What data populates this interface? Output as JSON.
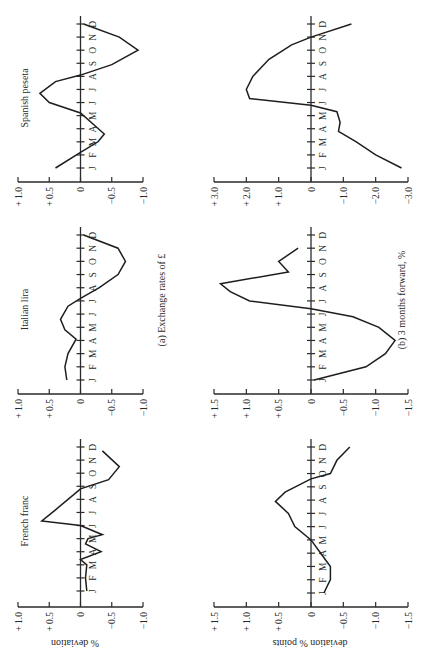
{
  "figure": {
    "orientation": "rotated 90deg counter-clockwise (text reads bottom-to-top)",
    "captions": {
      "a": "(a)  Exchange rates of £",
      "b": "(b)  3 months forward, %"
    },
    "ylabels": {
      "a": "% deviation",
      "b": "deviation % points"
    },
    "months": [
      "J",
      "F",
      "M",
      "A",
      "M",
      "J",
      "J",
      "A",
      "S",
      "O",
      "N",
      "D"
    ]
  },
  "chart_data": [
    {
      "type": "line",
      "row": "a",
      "title": "French franc",
      "xlabel": "",
      "ylabel": "% deviation",
      "x": [
        "J",
        "F",
        "M",
        "A",
        "M",
        "J",
        "J",
        "A",
        "S",
        "O",
        "N",
        "D"
      ],
      "x_points": [
        1.0,
        2.0,
        3.0,
        3.4,
        4.0,
        4.6,
        5.3,
        6.0,
        7.0,
        8.0,
        9.0,
        10.0,
        11.0,
        12.0
      ],
      "values": [
        -0.1,
        -0.1,
        -0.1,
        -0.03,
        -0.33,
        -0.1,
        -0.35,
        0.0,
        0.62,
        0.4,
        0.2,
        -0.05,
        -0.45,
        -0.6,
        -0.35
      ],
      "series": [
        {
          "name": "French franc",
          "points": [
            [
              1.0,
              -0.1
            ],
            [
              2.0,
              -0.08
            ],
            [
              3.0,
              -0.1
            ],
            [
              3.4,
              0.0
            ],
            [
              4.0,
              -0.33
            ],
            [
              4.6,
              -0.08
            ],
            [
              5.0,
              -0.12
            ],
            [
              5.3,
              -0.35
            ],
            [
              6.0,
              0.0
            ],
            [
              6.35,
              0.62
            ],
            [
              7.2,
              0.4
            ],
            [
              8.0,
              0.2
            ],
            [
              8.8,
              0.0
            ],
            [
              9.5,
              -0.45
            ],
            [
              10.5,
              -0.62
            ],
            [
              11.7,
              -0.35
            ]
          ]
        }
      ],
      "yticks": [
        "+ 1.0",
        "+ 0.5",
        "0",
        "−0.5",
        "−1.0"
      ],
      "ylim": [
        -1.0,
        1.0
      ],
      "grid": false
    },
    {
      "type": "line",
      "row": "a",
      "title": "Italian lira",
      "xlabel": "",
      "ylabel": "% deviation",
      "x": [
        "J",
        "F",
        "M",
        "A",
        "M",
        "J",
        "J",
        "A",
        "S",
        "O",
        "N",
        "D"
      ],
      "series": [
        {
          "name": "Italian lira",
          "points": [
            [
              1.0,
              0.22
            ],
            [
              2.0,
              0.25
            ],
            [
              3.0,
              0.2
            ],
            [
              4.1,
              0.07
            ],
            [
              4.8,
              0.25
            ],
            [
              5.6,
              0.32
            ],
            [
              6.6,
              0.2
            ],
            [
              7.2,
              0.0
            ],
            [
              8.0,
              -0.3
            ],
            [
              9.0,
              -0.6
            ],
            [
              10.0,
              -0.72
            ],
            [
              11.0,
              -0.6
            ],
            [
              12.0,
              -0.05
            ]
          ]
        }
      ],
      "yticks": [
        "+ 1.0",
        "+ 0.5",
        "0",
        "−0.5",
        "−1.0"
      ],
      "ylim": [
        -1.0,
        1.0
      ],
      "grid": false
    },
    {
      "type": "line",
      "row": "a",
      "title": "Spanish peseta",
      "xlabel": "",
      "ylabel": "% deviation",
      "x": [
        "J",
        "F",
        "M",
        "A",
        "M",
        "J",
        "J",
        "A",
        "S",
        "O",
        "N",
        "D"
      ],
      "series": [
        {
          "name": "Spanish peseta",
          "points": [
            [
              1.0,
              0.4
            ],
            [
              2.2,
              0.0
            ],
            [
              3.0,
              -0.28
            ],
            [
              3.6,
              -0.38
            ],
            [
              5.2,
              0.0
            ],
            [
              6.0,
              0.5
            ],
            [
              6.7,
              0.65
            ],
            [
              7.6,
              0.4
            ],
            [
              8.1,
              0.0
            ],
            [
              8.9,
              -0.5
            ],
            [
              10.0,
              -0.92
            ],
            [
              11.0,
              -0.62
            ],
            [
              12.0,
              -0.05
            ]
          ]
        }
      ],
      "yticks": [
        "+ 1.0",
        "+ 0.5",
        "0",
        "−0.5",
        "−1.0"
      ],
      "ylim": [
        -1.0,
        1.0
      ],
      "grid": false
    },
    {
      "type": "line",
      "row": "b",
      "title": "French franc, 3 months forward",
      "xlabel": "",
      "ylabel": "deviation % points",
      "x": [
        "J",
        "F",
        "M",
        "A",
        "M",
        "J",
        "J",
        "A",
        "S",
        "O",
        "N",
        "D"
      ],
      "series": [
        {
          "name": "French franc 3m fwd",
          "points": [
            [
              1.0,
              -0.2
            ],
            [
              2.0,
              -0.3
            ],
            [
              3.0,
              -0.3
            ],
            [
              4.0,
              -0.15
            ],
            [
              5.0,
              0.0
            ],
            [
              6.0,
              0.25
            ],
            [
              7.0,
              0.35
            ],
            [
              7.9,
              0.55
            ],
            [
              8.6,
              0.4
            ],
            [
              9.6,
              0.0
            ],
            [
              10.0,
              -0.3
            ],
            [
              11.0,
              -0.4
            ],
            [
              12.0,
              -0.6
            ]
          ]
        }
      ],
      "yticks": [
        "+ 1.5",
        "+ 1.0",
        "+ 0.5",
        "0",
        "−0.5",
        "−1.0",
        "−1.5"
      ],
      "ylim": [
        -1.5,
        1.5
      ],
      "grid": false
    },
    {
      "type": "line",
      "row": "b",
      "title": "Italian lira, 3 months forward",
      "xlabel": "",
      "ylabel": "deviation % points",
      "x": [
        "J",
        "F",
        "M",
        "A",
        "M",
        "J",
        "J",
        "A",
        "S",
        "O",
        "N",
        "D"
      ],
      "series": [
        {
          "name": "Italian lira 3m fwd",
          "points": [
            [
              1.0,
              -0.05
            ],
            [
              2.0,
              -0.85
            ],
            [
              3.0,
              -1.15
            ],
            [
              4.0,
              -1.3
            ],
            [
              5.0,
              -1.05
            ],
            [
              5.8,
              -0.65
            ],
            [
              6.4,
              0.0
            ],
            [
              7.0,
              0.95
            ],
            [
              7.7,
              1.25
            ],
            [
              8.3,
              1.4
            ],
            [
              9.2,
              0.35
            ],
            [
              10.0,
              0.5
            ],
            [
              11.0,
              0.2
            ]
          ]
        }
      ],
      "yticks": [
        "+ 1.5",
        "+ 1.0",
        "+ 0.5",
        "0",
        "−0.5",
        "−1.0",
        "−1.5"
      ],
      "ylim": [
        -1.5,
        1.5
      ],
      "grid": false
    },
    {
      "type": "line",
      "row": "b",
      "title": "Spanish peseta, 3 months forward",
      "xlabel": "",
      "ylabel": "",
      "x": [
        "J",
        "F",
        "M",
        "A",
        "M",
        "J",
        "J",
        "A",
        "S",
        "O",
        "N",
        "D"
      ],
      "series": [
        {
          "name": "Spanish peseta 3m fwd",
          "points": [
            [
              1.0,
              -2.8
            ],
            [
              2.0,
              -2.0
            ],
            [
              3.0,
              -1.4
            ],
            [
              3.8,
              -0.85
            ],
            [
              4.5,
              -0.9
            ],
            [
              5.3,
              -0.8
            ],
            [
              5.8,
              0.0
            ],
            [
              6.3,
              1.9
            ],
            [
              7.0,
              2.0
            ],
            [
              8.0,
              1.8
            ],
            [
              9.3,
              1.3
            ],
            [
              10.4,
              0.6
            ],
            [
              11.0,
              0.0
            ],
            [
              12.0,
              -1.25
            ]
          ]
        }
      ],
      "yticks": [
        "+ 3.0",
        "+ 2.0",
        "+ 1.0",
        "0",
        "−1.0",
        "−2.0",
        "−3.0"
      ],
      "ylim": [
        -3.0,
        3.0
      ],
      "grid": false
    }
  ]
}
